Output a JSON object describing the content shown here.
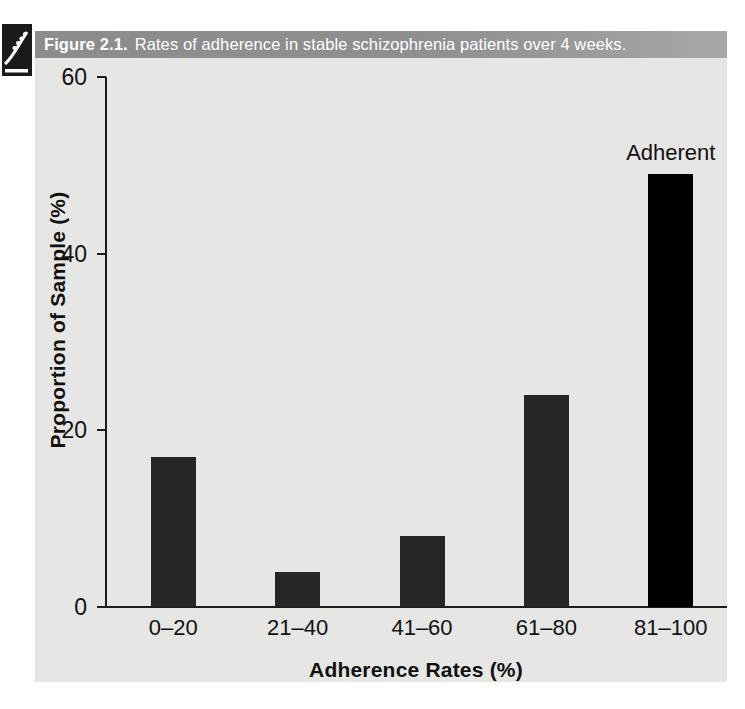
{
  "figure": {
    "icon_name": "figure-marker-icon",
    "caption_label": "Figure 2.1.",
    "caption_text": "Rates of adherence in stable schizophrenia patients over 4 weeks.",
    "caption_bar_color": "#8c8c8c",
    "body_background": "#e6e6e4"
  },
  "chart_data": {
    "type": "bar",
    "title": "Rates of adherence in stable schizophrenia patients over 4 weeks.",
    "categories": [
      "0–20",
      "21–40",
      "41–60",
      "61–80",
      "81–100"
    ],
    "values": [
      17,
      4,
      8,
      24,
      49
    ],
    "xlabel": "Adherence Rates (%)",
    "ylabel": "Proportion of Sample (%)",
    "ylim": [
      0,
      60
    ],
    "yticks": [
      0,
      20,
      40,
      60
    ],
    "ytick_labels": [
      "0",
      "20",
      "40",
      "60"
    ],
    "grid": false,
    "legend": null,
    "bar_color": "#262626",
    "highlight_bar_color": "#000000",
    "annotations": [
      {
        "text": "Adherent",
        "target_category": "81–100",
        "value": 49
      }
    ]
  }
}
